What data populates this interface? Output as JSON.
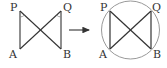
{
  "figure": {
    "colors": {
      "line": "#333333",
      "circle": "#999999",
      "angle_mark": "#888888",
      "label": "#333333",
      "background": "#ffffff"
    },
    "left": {
      "labels": {
        "P": "P",
        "Q": "Q",
        "A": "A",
        "B": "B"
      },
      "points": {
        "P": [
          20,
          11
        ],
        "Q": [
          61,
          11
        ],
        "A": [
          20,
          49
        ],
        "B": [
          61,
          49
        ]
      },
      "segments": [
        [
          "P",
          "A"
        ],
        [
          "Q",
          "B"
        ],
        [
          "P",
          "B"
        ],
        [
          "Q",
          "A"
        ]
      ],
      "angle_marks": [
        "P",
        "Q"
      ]
    },
    "arrow": {
      "from": [
        69,
        30
      ],
      "to": [
        90,
        30
      ]
    },
    "right": {
      "labels": {
        "P": "P",
        "Q": "Q",
        "A": "A",
        "B": "B"
      },
      "points": {
        "P": [
          110,
          11
        ],
        "Q": [
          151,
          11
        ],
        "A": [
          110,
          49
        ],
        "B": [
          151,
          49
        ]
      },
      "segments": [
        [
          "P",
          "A"
        ],
        [
          "Q",
          "B"
        ],
        [
          "P",
          "B"
        ],
        [
          "Q",
          "A"
        ]
      ],
      "circle": {
        "cx": 130.5,
        "cy": 30,
        "r": 29
      }
    }
  }
}
